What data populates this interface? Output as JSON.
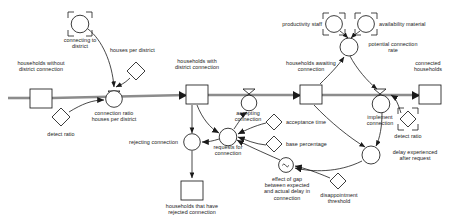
{
  "diagram": {
    "type": "stock-and-flow",
    "title": "",
    "canvas": {
      "width": 457,
      "height": 224,
      "background": "#ffffff"
    },
    "colors": {
      "stroke": "#1a1a1a",
      "flow_pipe": "#8c8c8c",
      "text": "#1a1a1a",
      "fill": "#ffffff"
    },
    "stocks": [
      {
        "id": "households-without-district-connection",
        "label": "households without\ndistrict connection",
        "x": 30,
        "y": 89,
        "w": 22,
        "h": 19,
        "label_x": 9,
        "label_y": 62
      },
      {
        "id": "households-with-district-connection",
        "label": "households with\ndistrict connection",
        "x": 186,
        "y": 85,
        "w": 22,
        "h": 19,
        "label_x": 165,
        "label_y": 60
      },
      {
        "id": "households-awaiting-connection",
        "label": "households awaiting\nconnection",
        "x": 300,
        "y": 85,
        "w": 22,
        "h": 19,
        "label_x": 277,
        "label_y": 62
      },
      {
        "id": "connected-households",
        "label": "connected\nhouseholds",
        "x": 419,
        "y": 85,
        "w": 22,
        "h": 19,
        "label_x": 400,
        "label_y": 62
      },
      {
        "id": "households-that-have-rejected-connection",
        "label": "households that have\nrejected connection",
        "x": 181,
        "y": 181,
        "w": 22,
        "h": 19,
        "label_x": 160,
        "label_y": 203
      }
    ],
    "flows": [
      {
        "id": "connection-ratio-houses-per-district",
        "label": "connection ratio\nhouses per district",
        "cx": 114,
        "cy": 98,
        "r": 8.5,
        "label_x": 88,
        "label_y": 110
      },
      {
        "id": "rejecting-connection",
        "label": "rejecting connection",
        "cx": 192,
        "cy": 142,
        "r": 8.5,
        "label_x": 118,
        "label_y": 139,
        "align": "right"
      },
      {
        "id": "accepting-connection",
        "label": "accepting\nconnection",
        "cx": 249,
        "cy": 102,
        "r": 8,
        "label_x": 229,
        "label_y": 110
      },
      {
        "id": "implement-connection",
        "label": "implement\nconnection",
        "cx": 381,
        "cy": 104,
        "r": 9,
        "label_x": 359,
        "label_y": 113
      }
    ],
    "auxiliaries": [
      {
        "id": "potential-connection-rate",
        "label": "potential connection\nrate",
        "shape": "circle",
        "cx": 349,
        "cy": 47,
        "r": 9,
        "label_x": 359,
        "label_y": 42,
        "align": "left"
      },
      {
        "id": "requests-for-connection",
        "label": "requests for\nconnection",
        "shape": "circle",
        "cx": 228,
        "cy": 137,
        "r": 9,
        "label_x": 208,
        "label_y": 143
      },
      {
        "id": "delay-experienced-after-request",
        "label": "delay experienced\nafter request",
        "shape": "circle",
        "cx": 371,
        "cy": 155,
        "r": 9,
        "label_x": 383,
        "label_y": 150,
        "align": "left"
      },
      {
        "id": "effect-of-gap-between-expected-and-actual-delay-in-connection",
        "label": "effect of gap\nbetween expected\nand actual delay in\nconnection",
        "shape": "lookup-circle",
        "cx": 286,
        "cy": 165,
        "r": 7.5,
        "label_x": 257,
        "label_y": 176
      }
    ],
    "constants": [
      {
        "id": "houses-per-district",
        "label": "houses per district",
        "shape": "diamond",
        "cx": 136,
        "cy": 71,
        "s": 9,
        "label_x": 111,
        "label_y": 48,
        "align": "left"
      },
      {
        "id": "detect-ratio-left",
        "label": "detect ratio",
        "shape": "diamond",
        "cx": 61,
        "cy": 117,
        "s": 9,
        "label_x": 41,
        "label_y": 131
      },
      {
        "id": "detect-ratio-right",
        "label": "detect ratio",
        "shape": "shadow-diamond",
        "cx": 408,
        "cy": 119,
        "s": 8,
        "label_x": 388,
        "label_y": 133
      },
      {
        "id": "acceptance-time",
        "label": "acceptance time",
        "shape": "diamond",
        "cx": 274,
        "cy": 122,
        "s": 8,
        "label_x": 285,
        "label_y": 119,
        "align": "left"
      },
      {
        "id": "base-percentage",
        "label": "base percentage",
        "shape": "diamond",
        "cx": 274,
        "cy": 144,
        "s": 8,
        "label_x": 285,
        "label_y": 141,
        "align": "left"
      },
      {
        "id": "disappointment-threshold",
        "label": "disappointment\nthreshold",
        "shape": "diamond",
        "cx": 338,
        "cy": 181,
        "s": 8,
        "label_x": 314,
        "label_y": 192
      }
    ],
    "shadow_variables": [
      {
        "id": "connecting-to-district",
        "label": "connecting to\ndistrict",
        "shape": "shadow-circle",
        "cx": 80,
        "cy": 24,
        "r": 9,
        "label_x": 57,
        "label_y": 36
      },
      {
        "id": "productivity-staff",
        "label": "productivity staff",
        "shape": "shadow-circle",
        "cx": 334,
        "cy": 24,
        "r": 8.5,
        "label_x": 275,
        "label_y": 22,
        "align": "right"
      },
      {
        "id": "availability-material",
        "label": "availability material",
        "shape": "shadow-circle",
        "cx": 366,
        "cy": 24,
        "r": 8.5,
        "label_x": 379,
        "label_y": 22,
        "align": "left"
      }
    ],
    "connectors": [
      {
        "from": "connecting-to-district",
        "to": "connection-ratio-houses-per-district"
      },
      {
        "from": "houses-per-district",
        "to": "connection-ratio-houses-per-district"
      },
      {
        "from": "detect-ratio-left",
        "to": "connection-ratio-houses-per-district"
      },
      {
        "from": "households-with-district-connection",
        "to": "requests-for-connection"
      },
      {
        "from": "households-with-district-connection",
        "to": "rejecting-connection"
      },
      {
        "from": "requests-for-connection",
        "to": "accepting-connection"
      },
      {
        "from": "requests-for-connection",
        "to": "rejecting-connection"
      },
      {
        "from": "acceptance-time",
        "to": "requests-for-connection"
      },
      {
        "from": "base-percentage",
        "to": "requests-for-connection"
      },
      {
        "from": "effect-of-gap-between-expected-and-actual-delay-in-connection",
        "to": "requests-for-connection"
      },
      {
        "from": "disappointment-threshold",
        "to": "effect-of-gap-between-expected-and-actual-delay-in-connection"
      },
      {
        "from": "delay-experienced-after-request",
        "to": "effect-of-gap-between-expected-and-actual-delay-in-connection"
      },
      {
        "from": "productivity-staff",
        "to": "potential-connection-rate"
      },
      {
        "from": "availability-material",
        "to": "potential-connection-rate"
      },
      {
        "from": "households-awaiting-connection",
        "to": "potential-connection-rate"
      },
      {
        "from": "potential-connection-rate",
        "to": "implement-connection"
      },
      {
        "from": "detect-ratio-right",
        "to": "implement-connection"
      },
      {
        "from": "implement-connection",
        "to": "delay-experienced-after-request"
      },
      {
        "from": "households-awaiting-connection",
        "to": "delay-experienced-after-request"
      }
    ],
    "flow_pipes": [
      {
        "from": "source-left",
        "to": "households-without-district-connection"
      },
      {
        "from": "households-without-district-connection",
        "to": "households-with-district-connection",
        "valve": "connection-ratio-houses-per-district"
      },
      {
        "from": "households-with-district-connection",
        "to": "households-awaiting-connection",
        "valve": "accepting-connection"
      },
      {
        "from": "households-awaiting-connection",
        "to": "connected-households",
        "valve": "implement-connection"
      },
      {
        "from": "rejecting-connection",
        "to": "households-that-have-rejected-connection"
      }
    ]
  }
}
